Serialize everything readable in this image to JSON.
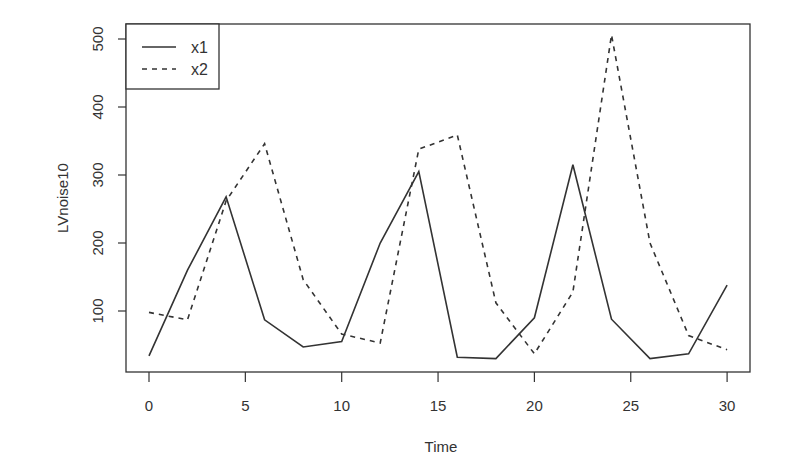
{
  "chart_data": {
    "type": "line",
    "title": "",
    "xlabel": "Time",
    "ylabel": "LVnoise10",
    "xlim": [
      0,
      30
    ],
    "ylim": [
      28,
      506
    ],
    "x_ticks": [
      0,
      5,
      10,
      15,
      20,
      25,
      30
    ],
    "y_ticks": [
      100,
      200,
      300,
      400,
      500
    ],
    "grid": false,
    "legend_position": "top-left",
    "x": [
      0,
      2,
      4,
      6,
      8,
      10,
      12,
      14,
      16,
      18,
      20,
      22,
      24,
      26,
      28,
      30
    ],
    "series": [
      {
        "name": "x1",
        "line_style": "solid",
        "values": [
          34,
          160,
          268,
          87,
          47,
          55,
          200,
          305,
          32,
          30,
          90,
          315,
          88,
          30,
          37,
          138
        ]
      },
      {
        "name": "x2",
        "line_style": "dashed",
        "values": [
          98,
          87,
          262,
          346,
          146,
          66,
          53,
          338,
          359,
          112,
          37,
          128,
          506,
          200,
          64,
          43
        ]
      }
    ]
  },
  "legend": {
    "items": [
      {
        "label": "x1",
        "style": "solid"
      },
      {
        "label": "x2",
        "style": "dashed"
      }
    ]
  },
  "colors": {
    "line": "#333333",
    "axis": "#333333",
    "background": "#ffffff"
  }
}
